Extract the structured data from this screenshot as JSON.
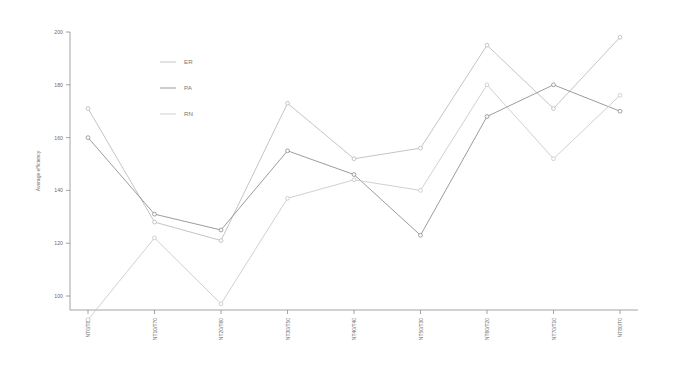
{
  "chart_data": {
    "type": "line",
    "title": "",
    "xlabel": "",
    "ylabel": "Average efficiency",
    "ylim": [
      90,
      200
    ],
    "yticks": [
      100,
      120,
      140,
      160,
      180,
      200
    ],
    "grid": false,
    "legend_position": "upper-center-left",
    "categories": [
      "NT0/T80",
      "NT10/T70",
      "NT20/T60",
      "NT30/T50",
      "NT40/T40",
      "NT50/T30",
      "NT60/T20",
      "NT70/T10",
      "NT80/T0"
    ],
    "series": [
      {
        "name": "ER",
        "color": "#b9b9b9",
        "values": [
          171,
          128,
          121,
          173,
          152,
          156,
          195,
          171,
          198
        ]
      },
      {
        "name": "PA",
        "color": "#8a8a8a",
        "values": [
          160,
          131,
          125,
          155,
          146,
          123,
          168,
          180,
          170
        ]
      },
      {
        "name": "RN",
        "color": "#c7c7c7",
        "values": [
          91,
          122,
          97,
          137,
          144,
          140,
          180,
          152,
          176
        ]
      }
    ]
  },
  "legend": {
    "entries": [
      {
        "label": "ER"
      },
      {
        "label": "PA"
      },
      {
        "label": "RN"
      }
    ]
  },
  "axes": {
    "y_title": "Average efficiency",
    "y_tick_labels": [
      "200",
      "180",
      "160",
      "140",
      "120",
      "100"
    ],
    "x_tick_labels": [
      "NT0/T80",
      "NT10/T70",
      "NT20/T60",
      "NT30/T50",
      "NT40/T40",
      "NT50/T30",
      "NT60/T20",
      "NT70/T10",
      "NT80/T0"
    ]
  }
}
